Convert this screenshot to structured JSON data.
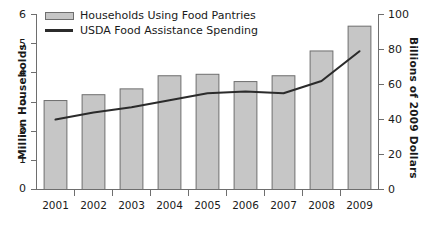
{
  "chart_data": {
    "type": "bar",
    "title": "",
    "subtitle": "",
    "xlabel": "",
    "ylabel": "Million Households",
    "ylabel_right": "Billions of 2009 Dollars",
    "categories": [
      "2001",
      "2002",
      "2003",
      "2004",
      "2005",
      "2006",
      "2007",
      "2008",
      "2009"
    ],
    "ylim": [
      0,
      6
    ],
    "ylim_right": [
      0,
      100
    ],
    "yticks": [
      "0",
      "1",
      "2",
      "3",
      "4",
      "5",
      "6"
    ],
    "yticks_right": [
      "0",
      "20",
      "40",
      "60",
      "80",
      "100"
    ],
    "grid": false,
    "legend_position": "top-left",
    "series": [
      {
        "name": "Households Using Food Pantries",
        "type": "bar",
        "axis": "left",
        "units": "Million Households",
        "color": "#c6c6c6",
        "edge_color": "#6e6e6e",
        "values": [
          3.05,
          3.25,
          3.45,
          3.9,
          3.95,
          3.7,
          3.9,
          4.75,
          5.6
        ]
      },
      {
        "name": "USDA Food Assistance Spending",
        "type": "line",
        "axis": "right",
        "units": "Billions of 2009 Dollars",
        "color": "#2b2b2b",
        "values": [
          40,
          44,
          47,
          51,
          55,
          56,
          55,
          62,
          79
        ]
      }
    ],
    "legend": [
      {
        "label": "Households Using Food Pantries",
        "marker": "bar-swatch"
      },
      {
        "label": "USDA Food Assistance Spending",
        "marker": "line-swatch"
      }
    ]
  },
  "colors": {
    "bar_fill": "#c6c6c6",
    "bar_edge": "#6e6e6e",
    "line": "#2b2b2b",
    "axis": "#6e6e6e",
    "text": "#1a1a1a",
    "background": "#ffffff"
  }
}
